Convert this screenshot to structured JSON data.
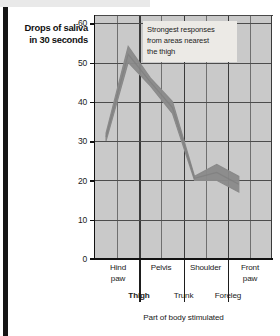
{
  "chart_data": {
    "type": "line",
    "title": "",
    "subtitle": "",
    "ylabel_line1": "Drops of saliva",
    "ylabel_line2": "in 30 seconds",
    "xlabel": "Part of body stimulated",
    "ylim": [
      0,
      62
    ],
    "yticks": [
      0,
      10,
      20,
      30,
      40,
      50,
      60
    ],
    "ytick_labels": [
      "0",
      "10",
      "20",
      "30",
      "40",
      "50",
      "60"
    ],
    "grid": true,
    "legend": "none",
    "annotations": [
      {
        "text_line1": "Strongest responses",
        "text_line2": "from areas nearest",
        "text_line3": "the thigh"
      }
    ],
    "categories": [
      "Hind paw",
      "Thigh",
      "Pelvis",
      "Trunk",
      "Shoulder",
      "Foreleg",
      "Front paw"
    ],
    "x_labels_row1": [
      "Hind paw",
      "Pelvis",
      "Shoulder",
      "Front paw"
    ],
    "x_labels_row2": [
      "Thigh",
      "Trunk",
      "Foreleg"
    ],
    "highlighted_category": "Thigh",
    "series": [
      {
        "name": "upper bound",
        "values": [
          32,
          54,
          46,
          40,
          21,
          24,
          21
        ]
      },
      {
        "name": "lower bound",
        "values": [
          30,
          50,
          44,
          37,
          20,
          20,
          17
        ]
      }
    ],
    "x_positions": [
      0,
      1,
      2,
      3,
      4,
      5,
      6
    ],
    "band_color": "#8a8a8a",
    "plot_background": "#c9c9c9",
    "annotation_background": "#eceae6"
  },
  "ytitle": {
    "line1": "Drops of saliva",
    "line2": "in 30 seconds"
  },
  "annotation": {
    "line1": "Strongest responses",
    "line2": "from areas nearest",
    "line3": "the thigh"
  },
  "yticks": {
    "t0": "0",
    "t10": "10",
    "t20": "20",
    "t30": "30",
    "t40": "40",
    "t50": "50",
    "t60": "60"
  },
  "xcats": {
    "hind_paw_1": "Hind",
    "hind_paw_2": "paw",
    "pelvis": "Pelvis",
    "shoulder": "Shoulder",
    "front_paw_1": "Front",
    "front_paw_2": "paw",
    "thigh": "Thigh",
    "trunk": "Trunk",
    "foreleg": "Foreleg"
  },
  "xtitle": "Part of body stimulated"
}
